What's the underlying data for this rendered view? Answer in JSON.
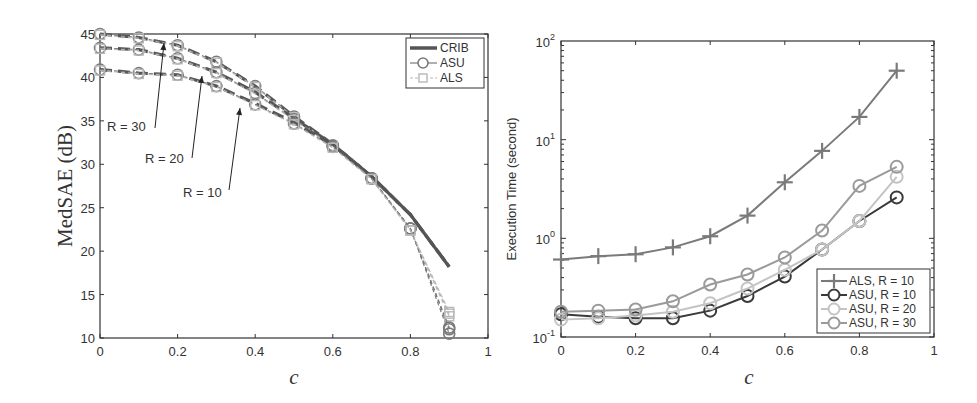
{
  "chart_data": [
    {
      "type": "line",
      "title": "",
      "xlabel": "c",
      "ylabel": "MedSAE (dB)",
      "xlim": [
        0,
        1
      ],
      "ylim": [
        10,
        45
      ],
      "xticks": [
        "0",
        "0.2",
        "0.4",
        "0.6",
        "0.8",
        "1"
      ],
      "yticks": [
        "10",
        "15",
        "20",
        "25",
        "30",
        "35",
        "40",
        "45"
      ],
      "grid": false,
      "legend_position": "upper right",
      "legend": [
        "CRIB",
        "ASU",
        "ALS"
      ],
      "annotations": [
        "R = 30",
        "R = 20",
        "R = 10"
      ],
      "x": [
        0,
        0.1,
        0.2,
        0.3,
        0.4,
        0.5,
        0.6,
        0.7,
        0.8,
        0.9
      ],
      "series": [
        {
          "name": "CRIB, R = 30",
          "style": "dash",
          "values": [
            45.0,
            44.6,
            43.7,
            41.8,
            39.0,
            35.5,
            32.3,
            28.6,
            24.2,
            18.2
          ]
        },
        {
          "name": "ASU, R = 30",
          "style": "circle",
          "values": [
            45.0,
            44.6,
            43.7,
            41.8,
            39.0,
            35.5,
            32.2,
            28.4,
            22.6,
            11.0
          ]
        },
        {
          "name": "ALS, R = 30",
          "style": "square",
          "values": [
            44.9,
            44.5,
            43.6,
            41.7,
            38.9,
            35.4,
            32.1,
            28.3,
            22.4,
            12.5
          ]
        },
        {
          "name": "CRIB, R = 20",
          "style": "dash",
          "values": [
            43.4,
            43.2,
            42.2,
            40.6,
            38.3,
            35.3,
            32.3,
            28.6,
            24.2,
            18.2
          ]
        },
        {
          "name": "ASU, R = 20",
          "style": "circle",
          "values": [
            43.4,
            43.2,
            42.2,
            40.6,
            38.2,
            35.2,
            32.1,
            28.4,
            22.6,
            11.2
          ]
        },
        {
          "name": "ALS, R = 20",
          "style": "square",
          "values": [
            43.3,
            43.1,
            42.1,
            40.5,
            38.1,
            35.1,
            32.0,
            28.3,
            22.4,
            12.8
          ]
        },
        {
          "name": "CRIB, R = 10",
          "style": "dash",
          "values": [
            40.9,
            40.5,
            40.3,
            39.0,
            37.0,
            34.8,
            32.2,
            28.6,
            24.2,
            18.2
          ]
        },
        {
          "name": "ASU, R = 10",
          "style": "circle",
          "values": [
            40.9,
            40.5,
            40.3,
            39.0,
            36.9,
            34.7,
            32.0,
            28.4,
            22.6,
            10.5
          ]
        },
        {
          "name": "ALS, R = 10",
          "style": "square",
          "values": [
            40.8,
            40.4,
            40.2,
            38.9,
            36.8,
            34.6,
            31.9,
            28.3,
            22.4,
            13.0
          ]
        }
      ]
    },
    {
      "type": "line",
      "title": "",
      "xlabel": "c",
      "ylabel": "Execution Time (second)",
      "yscale": "log",
      "xlim": [
        0,
        1
      ],
      "ylim": [
        0.1,
        100
      ],
      "xticks": [
        "0",
        "0.2",
        "0.4",
        "0.6",
        "0.8",
        "1"
      ],
      "yticks": [
        "10^-1",
        "10^0",
        "10^1",
        "10^2"
      ],
      "grid": false,
      "legend_position": "lower right",
      "legend": [
        "ALS, R = 10",
        "ASU, R = 10",
        "ASU, R = 20",
        "ASU, R = 30"
      ],
      "x": [
        0,
        0.1,
        0.2,
        0.3,
        0.4,
        0.5,
        0.6,
        0.7,
        0.8,
        0.9
      ],
      "series": [
        {
          "name": "ALS, R = 10",
          "values": [
            0.61,
            0.66,
            0.69,
            0.81,
            1.05,
            1.7,
            3.7,
            7.7,
            17,
            50
          ]
        },
        {
          "name": "ASU, R = 10",
          "values": [
            0.17,
            0.16,
            0.155,
            0.155,
            0.185,
            0.26,
            0.41,
            0.77,
            1.5,
            2.6
          ]
        },
        {
          "name": "ASU, R = 20",
          "values": [
            0.15,
            0.155,
            0.165,
            0.18,
            0.22,
            0.31,
            0.48,
            0.77,
            1.5,
            4.2
          ]
        },
        {
          "name": "ASU, R = 30",
          "values": [
            0.18,
            0.185,
            0.19,
            0.23,
            0.34,
            0.43,
            0.64,
            1.2,
            3.4,
            5.3
          ]
        }
      ]
    }
  ],
  "left": {
    "ylabel": "MedSAE (dB)",
    "xlabel": "c",
    "xticks": [
      "0",
      "0.2",
      "0.4",
      "0.6",
      "0.8",
      "1"
    ],
    "yticks": [
      "10",
      "15",
      "20",
      "25",
      "30",
      "35",
      "40",
      "45"
    ],
    "legend": [
      "CRIB",
      "ASU",
      "ALS"
    ],
    "annotations": [
      "R = 30",
      "R = 20",
      "R = 10"
    ]
  },
  "right": {
    "ylabel": "Execution Time (second)",
    "xlabel": "c",
    "xticks": [
      "0",
      "0.2",
      "0.4",
      "0.6",
      "0.8",
      "1"
    ],
    "ytick_base": "10",
    "ytick_exps": [
      "-1",
      "0",
      "1",
      "2"
    ],
    "legend": [
      "ALS, R = 10",
      "ASU, R = 10",
      "ASU, R = 20",
      "ASU, R = 30"
    ]
  },
  "colors": {
    "crib": "#555555",
    "asu": "#7a7a7a",
    "als": "#b8b8b8",
    "als_r10": "#7a7a7a",
    "asu_r10": "#3a3a3a",
    "asu_r20": "#c4c4c4",
    "asu_r30": "#9a9a9a",
    "axis": "#333333"
  }
}
